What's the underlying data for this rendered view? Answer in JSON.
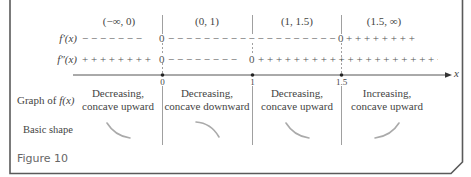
{
  "figure": {
    "caption": "Figure 10",
    "colors": {
      "border": "#5a5a5a",
      "lines": "#777777",
      "shape": "#aaaaaa",
      "text": "#444444"
    },
    "intervals": [
      "(−∞, 0)",
      "(0, 1)",
      "(1, 1.5)",
      "(1.5, ∞)"
    ],
    "rows": {
      "first_derivative": {
        "label": "f′(x)",
        "segments": [
          "− − − − − − −",
          "0",
          "− − − − − − − − − − − − − − − − − − − −",
          "0",
          "+ + + + + + + +"
        ]
      },
      "second_derivative": {
        "label": "f″(x)",
        "segments": [
          "+ + + + + + + +",
          "0",
          "− − − − − − − −",
          "0",
          "+ + + + + + + + + + + + + + + + + + + + +"
        ]
      }
    },
    "axis": {
      "label": "x",
      "ticks": [
        "0",
        "1",
        "1.5"
      ]
    },
    "graph_row": {
      "label_prefix": "Graph of ",
      "label_func": "f(x)",
      "descriptions": [
        {
          "line1": "Decreasing,",
          "line2": "concave upward"
        },
        {
          "line1": "Decreasing,",
          "line2": "concave downward"
        },
        {
          "line1": "Decreasing,",
          "line2": "concave upward"
        },
        {
          "line1": "Increasing,",
          "line2": "concave upward"
        }
      ]
    },
    "shape_row": {
      "label": "Basic shape",
      "shapes": [
        "decreasing-concave-up",
        "decreasing-concave-down",
        "decreasing-concave-up",
        "increasing-concave-up"
      ]
    }
  }
}
